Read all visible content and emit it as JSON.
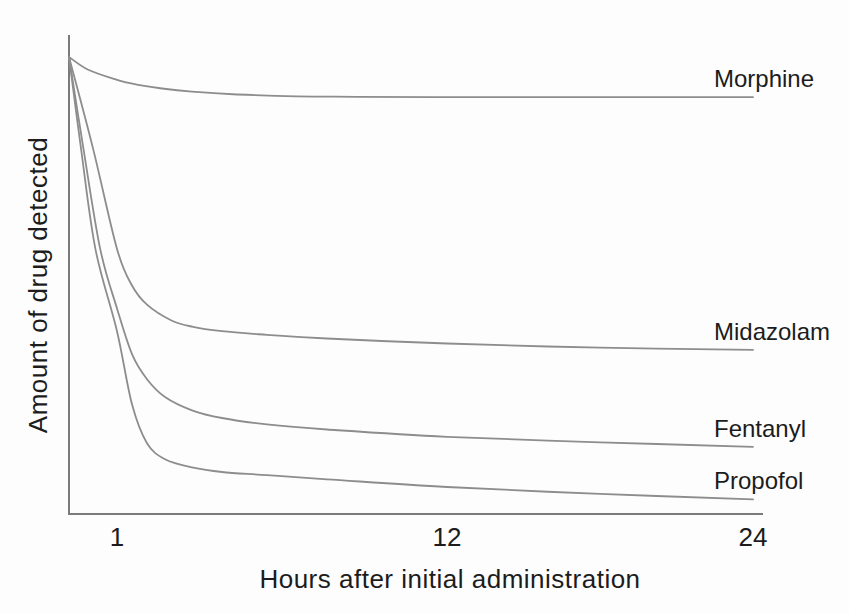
{
  "figure": {
    "background_color": "#fdfdfd"
  },
  "chart_data": {
    "type": "line",
    "title": "",
    "xlabel": "Hours after initial administration",
    "ylabel": "Amount of drug detected",
    "x_range": [
      0,
      24
    ],
    "x_ticks": [
      1,
      12,
      24
    ],
    "ylim": [
      0,
      100
    ],
    "y_axis_ticks": "none (unlabeled relative amount)",
    "grid": false,
    "legend_position": "labels at right end of each curve",
    "line_color": "#8d8d8d",
    "axis_color": "#7b7b7b",
    "text_color": "#1c1c1c",
    "series": [
      {
        "name": "Morphine",
        "points": [
          [
            0,
            100
          ],
          [
            0.4,
            97.2
          ],
          [
            1,
            95.0
          ],
          [
            1.7,
            93.9
          ],
          [
            2.5,
            93.1
          ],
          [
            3.5,
            92.4
          ],
          [
            5,
            91.8
          ],
          [
            7,
            91.4
          ],
          [
            9,
            91.3
          ],
          [
            12,
            91.2
          ],
          [
            16,
            91.2
          ],
          [
            20,
            91.2
          ],
          [
            24,
            91.2
          ]
        ]
      },
      {
        "name": "Midazolam",
        "points": [
          [
            0,
            100
          ],
          [
            0.5,
            80
          ],
          [
            1,
            58
          ],
          [
            1.5,
            50
          ],
          [
            2,
            45.8
          ],
          [
            2.8,
            42.4
          ],
          [
            3.5,
            41.0
          ],
          [
            4.5,
            40.0
          ],
          [
            6,
            39.2
          ],
          [
            8,
            38.4
          ],
          [
            12,
            37.3
          ],
          [
            18,
            36.4
          ],
          [
            24,
            35.9
          ]
        ]
      },
      {
        "name": "Fentanyl",
        "points": [
          [
            0,
            100
          ],
          [
            0.3,
            80
          ],
          [
            0.65,
            58
          ],
          [
            1,
            45
          ],
          [
            1.5,
            35
          ],
          [
            2,
            29.5
          ],
          [
            2.6,
            25.6
          ],
          [
            3.5,
            22.7
          ],
          [
            4.5,
            21.0
          ],
          [
            6,
            19.6
          ],
          [
            8,
            18.5
          ],
          [
            12,
            16.9
          ],
          [
            18,
            15.7
          ],
          [
            24,
            14.7
          ]
        ]
      },
      {
        "name": "Propofol",
        "points": [
          [
            0,
            100
          ],
          [
            0.25,
            80
          ],
          [
            0.55,
            58
          ],
          [
            1,
            40
          ],
          [
            1.5,
            24
          ],
          [
            2,
            15.5
          ],
          [
            2.6,
            12.0
          ],
          [
            3.5,
            10.2
          ],
          [
            4.5,
            9.2
          ],
          [
            6,
            8.5
          ],
          [
            8,
            7.6
          ],
          [
            12,
            5.9
          ],
          [
            18,
            4.4
          ],
          [
            24,
            3.2
          ]
        ]
      }
    ]
  }
}
